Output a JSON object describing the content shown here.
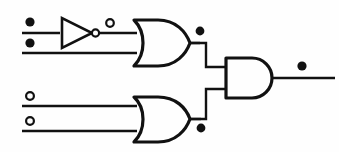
{
  "diagram": {
    "background_color": "#fefefe",
    "line_color": "#111111",
    "width": 339,
    "height": 152
  },
  "markers": {
    "filled_label": "filled-dot",
    "open_label": "open-dot"
  },
  "inputs": [
    {
      "id": "in-1",
      "marker": "filled",
      "marker_cx": 30,
      "marker_cy": 22,
      "wire_y": 33,
      "wire_x1": 22,
      "wire_x2": 60
    },
    {
      "id": "in-2",
      "marker": "filled",
      "marker_cx": 30,
      "marker_cy": 43,
      "wire_y": 53,
      "wire_x1": 22,
      "wire_x2": 137
    },
    {
      "id": "in-3",
      "marker": "open",
      "marker_cx": 30,
      "marker_cy": 96,
      "wire_y": 106,
      "wire_x1": 22,
      "wire_x2": 137
    },
    {
      "id": "in-4",
      "marker": "open",
      "marker_cx": 30,
      "marker_cy": 121,
      "wire_y": 131,
      "wire_x1": 22,
      "wire_x2": 137
    }
  ],
  "inverter": {
    "id": "not-gate-1",
    "tri_x1": 62,
    "tri_x2": 92,
    "tri_y_top": 18,
    "tri_y_bot": 48,
    "tri_y_mid": 33,
    "bubble_cx": 95.5,
    "bubble_cy": 33,
    "bubble_r": 3.6,
    "out_wire_x1": 99,
    "out_wire_x2": 137,
    "tap_cx": 110,
    "tap_cy": 23,
    "tap_r": 3.8
  },
  "or_gate_top": {
    "id": "or-gate-1",
    "x_left": 134,
    "x_right": 190,
    "y_top": 20,
    "y_bot": 66,
    "out_y": 43,
    "out_dot_cx": 200,
    "out_dot_cy": 31,
    "out_dot_r": 4.4
  },
  "or_gate_bottom": {
    "id": "or-gate-2",
    "x_left": 134,
    "x_right": 190,
    "y_top": 97,
    "y_bot": 142,
    "out_y": 119,
    "out_dot_cx": 201,
    "out_dot_cy": 128,
    "out_dot_r": 4.4
  },
  "and_gate": {
    "id": "and-gate-1",
    "x_left": 226,
    "x_right": 272,
    "y_top": 58,
    "y_bot": 98,
    "in_top_y": 67,
    "in_bot_y": 89,
    "out_y": 78
  },
  "interconnect": {
    "top_path": "M190,43 L206,43 L206,67 L226,67",
    "bottom_path": "M190,119 L206,119 L206,89 L226,89"
  },
  "output": {
    "id": "circuit-output",
    "wire_x1": 272,
    "wire_x2": 335,
    "wire_y": 78,
    "dot_cx": 302,
    "dot_cy": 66,
    "dot_r": 4.6
  }
}
